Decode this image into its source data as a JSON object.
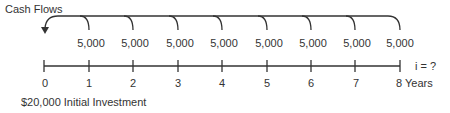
{
  "diagram": {
    "title": "Cash Flows",
    "cash_flows": [
      {
        "period": 1,
        "amount": "5,000"
      },
      {
        "period": 2,
        "amount": "5,000"
      },
      {
        "period": 3,
        "amount": "5,000"
      },
      {
        "period": 4,
        "amount": "5,000"
      },
      {
        "period": 5,
        "amount": "5,000"
      },
      {
        "period": 6,
        "amount": "5,000"
      },
      {
        "period": 7,
        "amount": "5,000"
      },
      {
        "period": 8,
        "amount": "5,000"
      }
    ],
    "timeline_labels": [
      "0",
      "1",
      "2",
      "3",
      "4",
      "5",
      "6",
      "7",
      "8 Years"
    ],
    "interest_label": "i = ?",
    "initial_investment": "$20,000 Initial Investment",
    "colors": {
      "line": "#333333",
      "text": "#333333"
    }
  }
}
